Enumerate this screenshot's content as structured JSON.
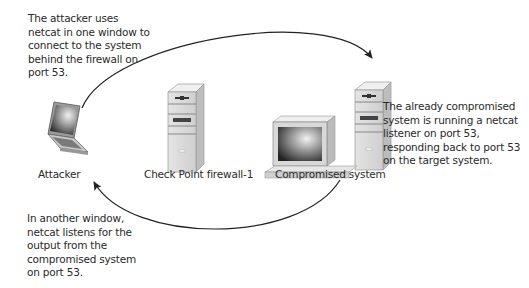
{
  "notes": {
    "top_left": "The attacker uses\nnetcat in one window to\nconnect to the system\nbehind the firewall on\nport 53.",
    "right": "The already compromised\nsystem is running a netcat\nlistener on port 53,\nresponding back to port 53\non the target system.",
    "bottom_left": "In another window,\nnetcat listens for the\noutput from the\ncompromised system\non port 53."
  },
  "nodes": {
    "attacker": {
      "label": "Attacker",
      "icon": "laptop-icon"
    },
    "firewall": {
      "label": "Check Point firewall-1",
      "icon": "server-tower-icon"
    },
    "compromised": {
      "label": "Compromised system",
      "icon": "desktop-computer-icon"
    }
  },
  "flows": [
    {
      "from": "attacker",
      "to": "compromised",
      "direction": "outbound via port 53"
    },
    {
      "from": "compromised",
      "to": "attacker",
      "direction": "response to port 53"
    }
  ]
}
